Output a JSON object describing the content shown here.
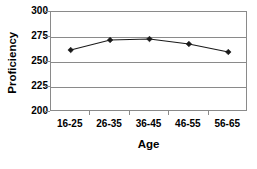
{
  "chart_data": {
    "type": "line",
    "title": "",
    "xlabel": "Age",
    "ylabel": "Proficiency",
    "categories": [
      "16-25",
      "26-35",
      "36-45",
      "46-55",
      "56-65"
    ],
    "values": [
      262,
      272,
      273,
      268,
      260
    ],
    "series": [
      {
        "name": "Proficiency",
        "values": [
          262,
          272,
          273,
          268,
          260
        ]
      }
    ],
    "ylim": [
      200,
      300
    ],
    "yticks": [
      200,
      225,
      250,
      275,
      300
    ],
    "ytick_labels": [
      "200",
      "225",
      "250",
      "275",
      "300"
    ],
    "grid": "horizontal",
    "legend": "none",
    "marker": "diamond",
    "line_color": "#1a1a1a",
    "marker_color": "#1a1a1a",
    "grid_color": "#8a8a8a",
    "background": "#ffffff"
  },
  "axes": {
    "y_title": "Proficiency",
    "x_title": "Age"
  }
}
